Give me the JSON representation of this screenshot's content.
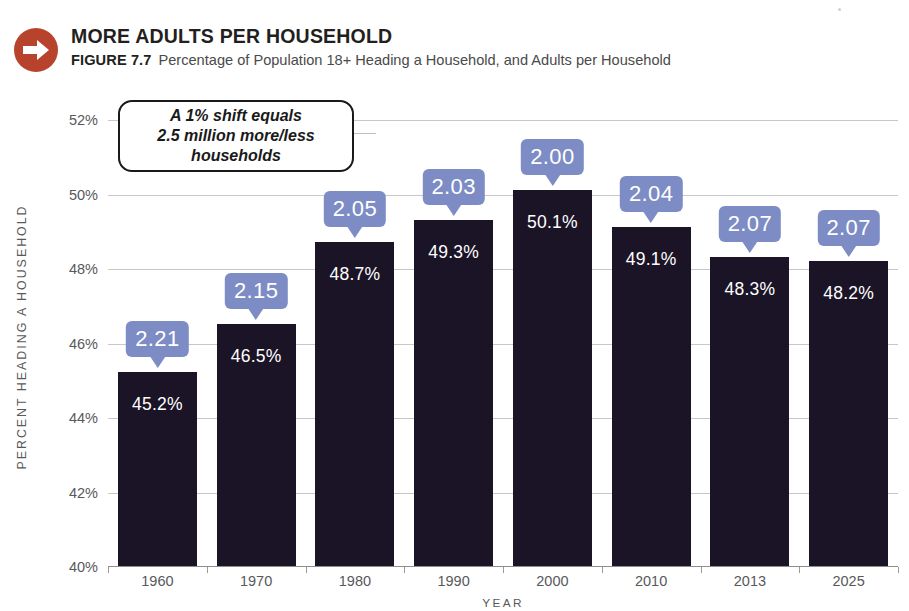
{
  "header": {
    "badge_icon": "right-arrow-icon",
    "badge_color": "#b8432c",
    "title": "MORE ADULTS PER HOUSEHOLD",
    "figure_number": "FIGURE 7.7",
    "figure_caption": "Percentage of Population 18+ Heading a Household, and Adults per Household"
  },
  "annotation": {
    "text": "A 1% shift equals\n2.5 million more/less\nhouseholds"
  },
  "colors": {
    "bar": "#1b1426",
    "bubble": "#7d8cc4",
    "gridline": "#c8c8c8",
    "axis_text": "#58595b",
    "badge": "#b8432c"
  },
  "chart_data": {
    "type": "bar",
    "title": "MORE ADULTS PER HOUSEHOLD",
    "subtitle": "Percentage of Population 18+ Heading a Household, and Adults per Household",
    "xlabel": "YEAR",
    "ylabel": "PERCENT HEADING A HOUSEHOLD",
    "categories": [
      "1960",
      "1970",
      "1980",
      "1990",
      "2000",
      "2010",
      "2013",
      "2025"
    ],
    "values": [
      45.2,
      46.5,
      48.7,
      49.3,
      50.1,
      49.1,
      48.3,
      48.2
    ],
    "value_labels": [
      "45.2%",
      "46.5%",
      "48.7%",
      "49.3%",
      "50.1%",
      "49.1%",
      "48.3%",
      "48.2%"
    ],
    "bubble_labels": [
      "2.21",
      "2.15",
      "2.05",
      "2.03",
      "2.00",
      "2.04",
      "2.07",
      "2.07"
    ],
    "bubble_series_name": "Adults per Household",
    "ylim": [
      40,
      52
    ],
    "yticks": [
      40,
      42,
      44,
      46,
      48,
      50,
      52
    ],
    "ytick_labels": [
      "40%",
      "42%",
      "44%",
      "46%",
      "48%",
      "50%",
      "52%"
    ],
    "grid": true,
    "legend": "none"
  }
}
